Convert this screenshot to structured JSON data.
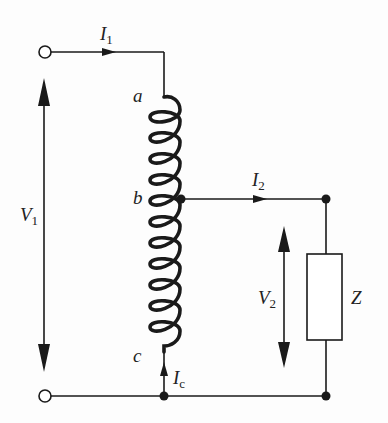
{
  "diagram": {
    "colors": {
      "line": "#1a1a1a",
      "background": "#fdfdfd"
    },
    "labels": {
      "I1": {
        "main": "I",
        "sub": "1"
      },
      "I2": {
        "main": "I",
        "sub": "2"
      },
      "Ic": {
        "main": "I",
        "sub": "c"
      },
      "V1": {
        "main": "V",
        "sub": "1"
      },
      "V2": {
        "main": "V",
        "sub": "2"
      },
      "Z": "Z",
      "tap_a": "a",
      "tap_b": "b",
      "tap_c": "c"
    },
    "components": [
      {
        "type": "terminal",
        "name": "input-top"
      },
      {
        "type": "terminal",
        "name": "input-bottom"
      },
      {
        "type": "coil",
        "name": "autotransformer-winding",
        "taps": [
          "a",
          "b",
          "c"
        ]
      },
      {
        "type": "impedance",
        "name": "load",
        "label": "Z"
      },
      {
        "type": "junction",
        "name": "tap-b"
      },
      {
        "type": "junction",
        "name": "bottom-node"
      },
      {
        "type": "junction",
        "name": "load-top"
      },
      {
        "type": "junction",
        "name": "load-bottom"
      }
    ]
  }
}
